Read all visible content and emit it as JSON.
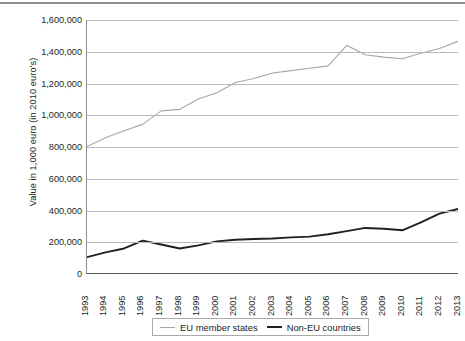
{
  "chart_data": {
    "type": "line",
    "title": "",
    "xlabel": "",
    "ylabel": "Value in 1,000 euro (in 2010 euro's)",
    "categories": [
      "1993",
      "1994",
      "1995",
      "1996",
      "1997",
      "1998",
      "1999",
      "2000",
      "2001",
      "2002",
      "2003",
      "2004",
      "2005",
      "2006",
      "2007",
      "2008",
      "2009",
      "2010",
      "2011",
      "2012",
      "2013"
    ],
    "ylim": [
      0,
      1600000
    ],
    "ytick_labels": [
      "1,600,000",
      "1,400,000",
      "1,200,000",
      "1,000,000",
      "800,000",
      "600,000",
      "400,000",
      "200,000",
      "0"
    ],
    "ytick_values": [
      1600000,
      1400000,
      1200000,
      1000000,
      800000,
      600000,
      400000,
      200000,
      0
    ],
    "grid": true,
    "legend_position": "bottom",
    "series": [
      {
        "name": "EU member states",
        "color": "#a6a6a6",
        "values": [
          800000,
          855000,
          900000,
          940000,
          1025000,
          1035000,
          1100000,
          1140000,
          1205000,
          1230000,
          1265000,
          1280000,
          1295000,
          1310000,
          1440000,
          1380000,
          1365000,
          1355000,
          1390000,
          1420000,
          1465000
        ]
      },
      {
        "name": "Non-EU countries",
        "color": "#231f20",
        "values": [
          100000,
          130000,
          155000,
          205000,
          180000,
          155000,
          175000,
          200000,
          210000,
          215000,
          218000,
          225000,
          230000,
          245000,
          265000,
          285000,
          280000,
          270000,
          320000,
          375000,
          405000
        ]
      }
    ]
  },
  "legend": {
    "entries": [
      {
        "label": "EU member states"
      },
      {
        "label": "Non-EU countries"
      }
    ]
  }
}
